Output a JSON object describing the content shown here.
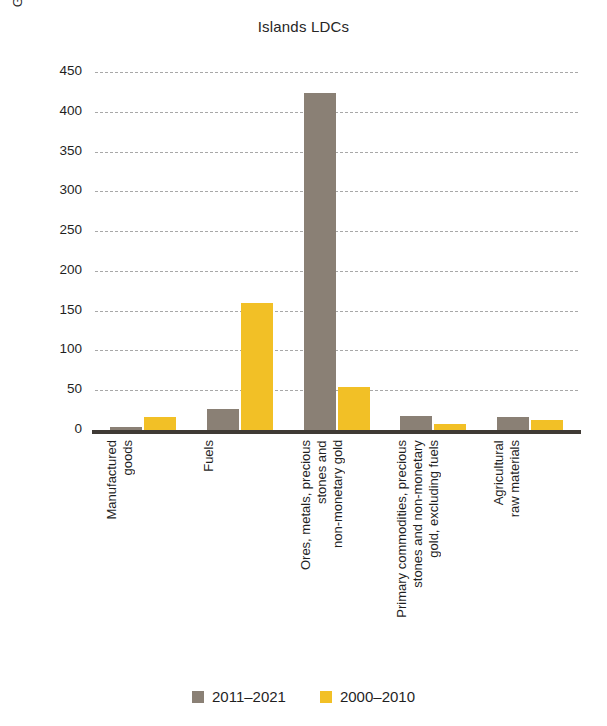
{
  "chart_data": {
    "type": "bar",
    "title": "Islands LDCs",
    "xlabel": "",
    "ylabel": "Growth rate, per cent (average)",
    "ylim": [
      0,
      450
    ],
    "ytick_step": 50,
    "yticks": [
      "450",
      "400",
      "350",
      "300",
      "250",
      "200",
      "150",
      "100",
      "50",
      "0"
    ],
    "grid": true,
    "legend_position": "bottom",
    "categories": [
      "Manufactured\ngoods",
      "Fuels",
      "Ores, metals, precious\nstones and\nnon-monetary gold",
      "Primary commodities, precious\nstones and non-monetary\ngold, excluding fuels",
      "Agricultural\nraw materials"
    ],
    "series": [
      {
        "name": "2011–2021",
        "color": "#8a8075",
        "values": [
          4,
          26,
          424,
          17,
          16
        ]
      },
      {
        "name": "2000–2010",
        "color": "#f2c026",
        "values": [
          16,
          160,
          54,
          8,
          13
        ]
      }
    ]
  },
  "legend": {
    "items": [
      {
        "label": "2011–2021",
        "color": "#8a8075"
      },
      {
        "label": "2000–2010",
        "color": "#f2c026"
      }
    ]
  }
}
